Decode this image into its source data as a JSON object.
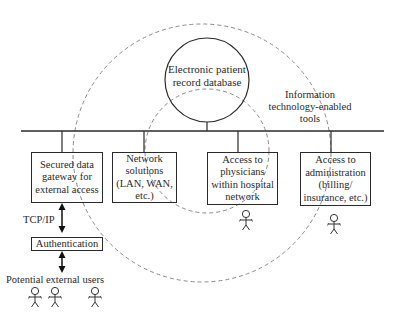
{
  "diagram": {
    "database": {
      "label": "Electronic patient\nrecord database"
    },
    "it_tools_label": "Information\ntechnology-enabled\ntools",
    "boxes": [
      {
        "id": "gateway",
        "label": "Secured data\ngateway for\nexternal access"
      },
      {
        "id": "network",
        "label": "Network\nsolutions\n(LAN, WAN,\netc.)"
      },
      {
        "id": "physicians",
        "label": "Access to\nphysicians\nwithin hospital\nnetwork"
      },
      {
        "id": "administration",
        "label": "Access to\nadministration\n(billing/\ninsurance, etc.)"
      }
    ],
    "protocol_label": "TCP/IP",
    "authentication_label": "Authentication",
    "external_users_label": "Potential external users",
    "icons": {
      "user": "stick-figure-icon"
    },
    "colors": {
      "line": "#2a2a2a",
      "dashed": "#8a8a8a",
      "background": "#ffffff"
    }
  }
}
